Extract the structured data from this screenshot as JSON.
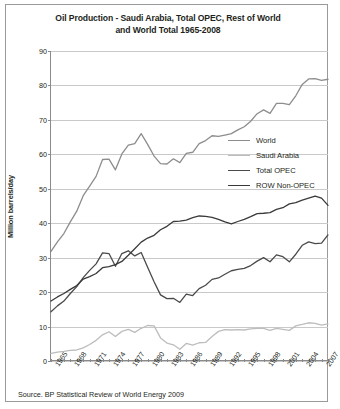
{
  "title": "Oil Production - Saudi Arabia, Total OPEC, Rest of World and World Total 1965-2008",
  "title_line1": "Oil Production - Saudi Arabia, Total OPEC, Rest of World",
  "title_line2": "and World Total 1965-2008",
  "source": "Source. BP Statistical Review of World Energy 2009",
  "legend": {
    "items": [
      {
        "label": "World",
        "color": "#8d8d8d"
      },
      {
        "label": "Saudi Arabia",
        "color": "#bdbdbd"
      },
      {
        "label": "Total OPEC",
        "color": "#4a4a4a"
      },
      {
        "label": "ROW Non-OPEC",
        "color": "#3a3a3a"
      }
    ]
  },
  "chart_data": {
    "type": "line",
    "title": "Oil Production - Saudi Arabia, Total OPEC, Rest of World and World Total 1965-2008",
    "xlabel": "",
    "ylabel": "Million barrels/day",
    "ylim": [
      0,
      90
    ],
    "yticks": [
      0,
      10,
      20,
      30,
      40,
      50,
      60,
      70,
      80,
      90
    ],
    "xlim": [
      1965,
      2008
    ],
    "xticks": [
      1965,
      1968,
      1971,
      1974,
      1977,
      1980,
      1983,
      1986,
      1989,
      1992,
      1995,
      1998,
      2001,
      2004,
      2007
    ],
    "grid": true,
    "legend_position": "center-right",
    "x": [
      1965,
      1966,
      1967,
      1968,
      1969,
      1970,
      1971,
      1972,
      1973,
      1974,
      1975,
      1976,
      1977,
      1978,
      1979,
      1980,
      1981,
      1982,
      1983,
      1984,
      1985,
      1986,
      1987,
      1988,
      1989,
      1990,
      1991,
      1992,
      1993,
      1994,
      1995,
      1996,
      1997,
      1998,
      1999,
      2000,
      2001,
      2002,
      2003,
      2004,
      2005,
      2006,
      2007,
      2008
    ],
    "series": [
      {
        "name": "World",
        "color": "#8d8d8d",
        "values": [
          31.8,
          34.6,
          37.0,
          40.4,
          43.5,
          48.0,
          50.8,
          53.6,
          58.5,
          58.6,
          55.5,
          60.1,
          62.7,
          63.1,
          66.0,
          62.9,
          59.5,
          57.3,
          57.2,
          58.7,
          57.6,
          60.3,
          60.6,
          63.1,
          64.0,
          65.4,
          65.2,
          65.6,
          66.0,
          67.1,
          68.0,
          69.6,
          71.8,
          72.9,
          71.9,
          74.8,
          74.8,
          74.4,
          77.0,
          80.3,
          81.9,
          82.0,
          81.5,
          81.8
        ]
      },
      {
        "name": "Saudi Arabia",
        "color": "#bdbdbd",
        "values": [
          2.2,
          2.6,
          2.8,
          3.1,
          3.2,
          3.8,
          4.8,
          6.0,
          7.6,
          8.5,
          7.1,
          8.6,
          9.2,
          8.3,
          9.5,
          10.3,
          10.2,
          6.7,
          5.2,
          4.7,
          3.4,
          5.1,
          4.6,
          5.3,
          5.4,
          7.1,
          8.6,
          9.1,
          9.0,
          9.1,
          9.0,
          9.3,
          9.5,
          9.5,
          8.9,
          9.5,
          9.2,
          8.9,
          10.2,
          10.6,
          11.1,
          10.9,
          10.4,
          10.8
        ]
      },
      {
        "name": "Total OPEC",
        "color": "#4a4a4a",
        "values": [
          14.3,
          16.0,
          17.4,
          19.6,
          21.6,
          24.2,
          26.3,
          28.2,
          31.4,
          31.2,
          27.5,
          31.2,
          32.0,
          30.5,
          31.5,
          27.2,
          23.0,
          19.2,
          18.1,
          18.2,
          17.0,
          19.4,
          19.0,
          21.0,
          22.0,
          23.7,
          24.1,
          25.2,
          26.2,
          26.6,
          26.9,
          27.7,
          29.0,
          30.0,
          28.8,
          30.8,
          30.3,
          28.8,
          31.0,
          33.6,
          34.6,
          34.1,
          34.2,
          36.6
        ]
      },
      {
        "name": "ROW Non-OPEC",
        "color": "#3a3a3a",
        "values": [
          17.4,
          18.6,
          19.6,
          20.8,
          21.9,
          23.8,
          24.5,
          25.4,
          27.1,
          27.4,
          28.0,
          28.9,
          30.7,
          32.6,
          34.5,
          35.7,
          36.5,
          38.1,
          39.1,
          40.5,
          40.6,
          40.9,
          41.6,
          42.1,
          42.0,
          41.7,
          41.1,
          40.4,
          39.8,
          40.5,
          41.1,
          41.9,
          42.8,
          42.9,
          43.1,
          44.0,
          44.5,
          45.6,
          46.0,
          46.7,
          47.3,
          47.9,
          47.3,
          45.2
        ]
      }
    ]
  }
}
